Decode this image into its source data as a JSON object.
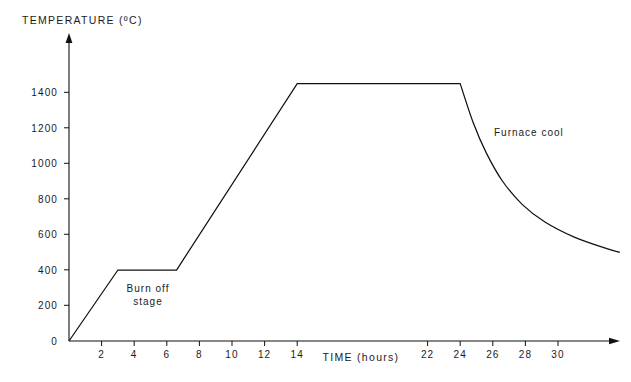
{
  "chart_data": {
    "type": "line",
    "title": "",
    "ylabel": "TEMPERATURE (ºC)",
    "xlabel": "TIME (hours)",
    "xlim": [
      0,
      34
    ],
    "ylim": [
      0,
      1560
    ],
    "grid": false,
    "legend": "none",
    "x_ticks": [
      2,
      4,
      6,
      8,
      10,
      12,
      14,
      22,
      24,
      26,
      28,
      30
    ],
    "x_tick_labels": [
      "2",
      "4",
      "6",
      "8",
      "10",
      "12",
      "14",
      "22",
      "24",
      "26",
      "28",
      "30"
    ],
    "y_ticks": [
      0,
      200,
      400,
      600,
      800,
      1000,
      1200,
      1400
    ],
    "y_tick_labels": [
      "0",
      "200",
      "400",
      "600",
      "800",
      "1000",
      "1200",
      "1400"
    ],
    "series": [
      {
        "name": "Firing schedule",
        "x": [
          0,
          3,
          6.6,
          14,
          24,
          24.8,
          25.6,
          26.6,
          27.8,
          29.2,
          31.0,
          33.0,
          33.8
        ],
        "y": [
          0,
          400,
          400,
          1450,
          1450,
          1230,
          1060,
          900,
          770,
          670,
          585,
          520,
          500
        ]
      }
    ],
    "annotations": [
      {
        "name": "burn-off-stage",
        "text_lines": [
          "Burn off",
          "stage"
        ],
        "x": 5.0,
        "y": 290
      },
      {
        "name": "furnace-cool",
        "text_lines": [
          "Furnace cool"
        ],
        "x": 26.5,
        "y": 1230
      }
    ]
  },
  "axes": {
    "y_axis_title": "TEMPERATURE (ºC)",
    "x_axis_title": "TIME (hours)",
    "y_labels": [
      "1400",
      "1200",
      "1000",
      "800",
      "600",
      "400",
      "200",
      "0"
    ],
    "x_labels_left": [
      "2",
      "4",
      "6",
      "8",
      "10",
      "12",
      "14"
    ],
    "x_labels_right": [
      "22",
      "24",
      "26",
      "28",
      "30"
    ]
  },
  "annotations": {
    "burn_off_line1": "Burn off",
    "burn_off_line2": "stage",
    "furnace_cool": "Furnace cool"
  }
}
